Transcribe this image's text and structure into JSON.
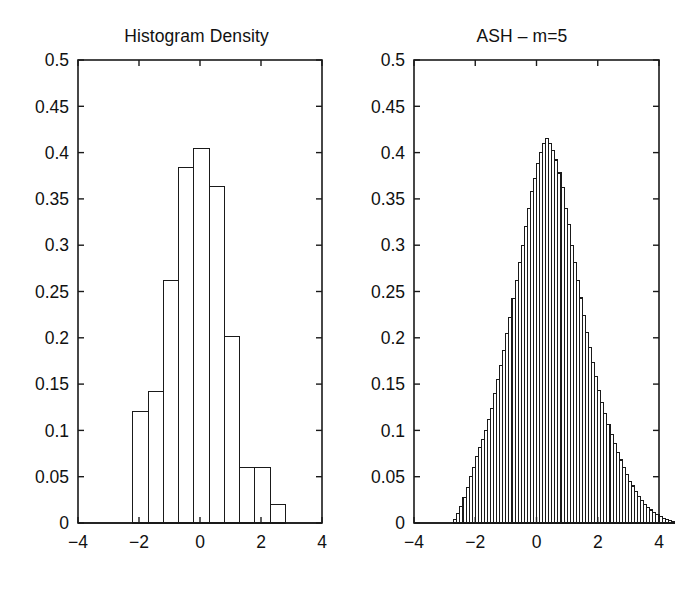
{
  "figure": {
    "background_color": "#ffffff",
    "line_color": "#1a1a1a",
    "panel_count": 2
  },
  "panels": [
    {
      "id": "histogram-density",
      "title": "Histogram Density",
      "x_ticks": [
        "-4",
        "-2",
        "0",
        "2",
        "4"
      ],
      "y_ticks": [
        "0",
        "0.05",
        "0.1",
        "0.15",
        "0.2",
        "0.25",
        "0.3",
        "0.35",
        "0.4",
        "0.45",
        "0.5"
      ]
    },
    {
      "id": "ash-m5",
      "title": "ASH – m=5",
      "x_ticks": [
        "-4",
        "-2",
        "0",
        "2",
        "4"
      ],
      "y_ticks": [
        "0",
        "0.05",
        "0.1",
        "0.15",
        "0.2",
        "0.25",
        "0.3",
        "0.35",
        "0.4",
        "0.45",
        "0.5"
      ]
    }
  ],
  "chart_data": [
    {
      "type": "bar",
      "id": "histogram-density",
      "title": "Histogram Density",
      "xlabel": "",
      "ylabel": "",
      "xlim": [
        -4,
        4
      ],
      "ylim": [
        0,
        0.5
      ],
      "grid": false,
      "legend": null,
      "bin_width": 0.5,
      "bin_edges": [
        -2.2,
        -1.7,
        -1.2,
        -0.7,
        -0.2,
        0.3,
        0.8,
        1.3,
        1.8,
        2.3,
        2.8
      ],
      "bin_left_edges": [
        -2.2,
        -1.7,
        -1.2,
        -0.7,
        -0.2,
        0.3,
        0.8,
        1.3,
        1.8,
        2.3
      ],
      "values": [
        0.12,
        0.142,
        0.262,
        0.384,
        0.404,
        0.363,
        0.201,
        0.06,
        0.06,
        0.02
      ],
      "x_tick_values": [
        -4,
        -2,
        0,
        2,
        4
      ],
      "y_tick_values": [
        0,
        0.05,
        0.1,
        0.15,
        0.2,
        0.25,
        0.3,
        0.35,
        0.4,
        0.45,
        0.5
      ]
    },
    {
      "type": "bar",
      "id": "ash-m5",
      "title": "ASH – m=5",
      "xlabel": "",
      "ylabel": "",
      "xlim": [
        -4,
        4
      ],
      "ylim": [
        0,
        0.5
      ],
      "grid": false,
      "legend": null,
      "bin_width": 0.1,
      "bin_start": -2.7,
      "values": [
        0.004,
        0.01,
        0.018,
        0.028,
        0.038,
        0.05,
        0.06,
        0.072,
        0.082,
        0.09,
        0.1,
        0.112,
        0.124,
        0.14,
        0.155,
        0.17,
        0.186,
        0.205,
        0.222,
        0.242,
        0.262,
        0.281,
        0.3,
        0.32,
        0.34,
        0.358,
        0.372,
        0.388,
        0.4,
        0.41,
        0.415,
        0.41,
        0.402,
        0.392,
        0.378,
        0.362,
        0.34,
        0.322,
        0.3,
        0.281,
        0.262,
        0.243,
        0.224,
        0.206,
        0.19,
        0.173,
        0.158,
        0.143,
        0.13,
        0.118,
        0.106,
        0.096,
        0.086,
        0.076,
        0.068,
        0.06,
        0.052,
        0.045,
        0.04,
        0.034,
        0.029,
        0.024,
        0.02,
        0.017,
        0.014,
        0.011,
        0.009,
        0.007,
        0.005,
        0.004,
        0.003,
        0.002
      ],
      "x_tick_values": [
        -4,
        -2,
        0,
        2,
        4
      ],
      "y_tick_values": [
        0,
        0.05,
        0.1,
        0.15,
        0.2,
        0.25,
        0.3,
        0.35,
        0.4,
        0.45,
        0.5
      ]
    }
  ]
}
